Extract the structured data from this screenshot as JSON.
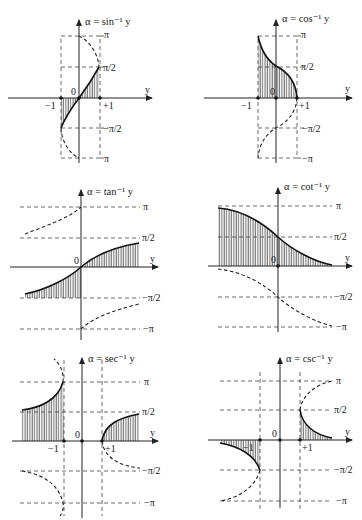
{
  "figure": {
    "panels": [
      {
        "id": "asin",
        "title": "α = sin⁻¹ y",
        "x_label": "y",
        "origin_label": "0",
        "ticks_x": [
          "−1",
          "+1"
        ],
        "ticks_alpha": [
          "π",
          "π/2",
          "−π/2",
          "−π"
        ],
        "principal_range": "[−π/2, π/2]",
        "shaded": "between principal branch and y-axis"
      },
      {
        "id": "acos",
        "title": "α = cos⁻¹ y",
        "x_label": "y",
        "origin_label": "0",
        "ticks_x": [
          "−1",
          "+1"
        ],
        "ticks_alpha": [
          "π",
          "π/2",
          "−π/2",
          "−π"
        ],
        "principal_range": "[0, π]",
        "shaded": "under principal branch"
      },
      {
        "id": "atan",
        "title": "α = tan⁻¹ y",
        "x_label": "y",
        "origin_label": "0",
        "ticks_alpha": [
          "π",
          "π/2",
          "−π/2",
          "−π"
        ],
        "principal_range": "(−π/2, π/2)",
        "shaded": "between curve and y-axis"
      },
      {
        "id": "acot",
        "title": "α = cot⁻¹ y",
        "x_label": "y",
        "origin_label": "0",
        "ticks_alpha": [
          "π",
          "π/2",
          "−π/2",
          "−π"
        ],
        "principal_range": "(0, π)",
        "shaded": "under principal branch"
      },
      {
        "id": "asec",
        "title": "α = sec⁻¹ y",
        "x_label": "y",
        "origin_label": "0",
        "ticks_x": [
          "−1",
          "+1"
        ],
        "ticks_alpha": [
          "π",
          "π/2",
          "−π/2",
          "−π"
        ],
        "principal_range": "[0, π/2) ∪ (π/2, π]",
        "shaded": "under principal branches"
      },
      {
        "id": "acsc",
        "title": "α = csc⁻¹ y",
        "x_label": "y",
        "origin_label": "0",
        "ticks_x": [
          "−1",
          "+1"
        ],
        "ticks_alpha": [
          "π",
          "π/2",
          "−π/2",
          "−π"
        ],
        "principal_range": "[−π/2, 0) ∪ (0, π/2]",
        "shaded": "between principal branches and y-axis"
      }
    ]
  },
  "labels": {
    "asin_title": "α = sin⁻¹ y",
    "acos_title": "α = cos⁻¹ y",
    "atan_title": "α = tan⁻¹ y",
    "acot_title": "α = cot⁻¹ y",
    "asec_title": "α = sec⁻¹ y",
    "acsc_title": "α = csc⁻¹ y",
    "y": "y",
    "zero": "0",
    "minus_one": "−1",
    "plus_one": "+1",
    "pi": "π",
    "half_pi": "π/2",
    "neg_half_pi": "−π/2",
    "neg_pi": "−π"
  },
  "colors": {
    "ink": "#222222",
    "background": "#ffffff",
    "hatch": "#555555"
  }
}
